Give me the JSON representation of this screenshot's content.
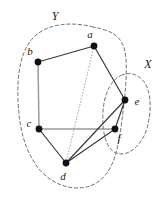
{
  "figure": {
    "width": 164,
    "height": 203,
    "background": "#ffffff"
  },
  "labels": {
    "a": "a",
    "b": "b",
    "c": "c",
    "d": "d",
    "e": "e",
    "f": "f",
    "X": "X",
    "Y": "Y"
  },
  "colors": {
    "vertex": "#111111",
    "edge_dark": "#3a3a3a",
    "edge_gray": "#9a9a9a",
    "edge_dotted": "#b0b0b0",
    "region_boundary": "#6e6e6e",
    "text": "#1a1a1a",
    "background": "#ffffff"
  },
  "chart_data": {
    "type": "diagram",
    "title": "",
    "nodes": [
      {
        "id": "a",
        "label": "a",
        "x": 94,
        "y": 46,
        "label_x": 90,
        "label_y": 38,
        "r": 3.4
      },
      {
        "id": "b",
        "label": "b",
        "x": 38,
        "y": 62,
        "label_x": 30,
        "label_y": 55,
        "r": 3.4
      },
      {
        "id": "c",
        "label": "c",
        "x": 39,
        "y": 129,
        "label_x": 29,
        "label_y": 127,
        "r": 3.4
      },
      {
        "id": "d",
        "label": "d",
        "x": 66,
        "y": 163,
        "label_x": 63,
        "label_y": 180,
        "r": 3.4
      },
      {
        "id": "e",
        "label": "e",
        "x": 125,
        "y": 100,
        "label_x": 137,
        "label_y": 105,
        "r": 3.4
      },
      {
        "id": "f",
        "label": "f",
        "x": 115,
        "y": 129,
        "label_x": 119,
        "label_y": 142,
        "r": 3.4
      }
    ],
    "edges": [
      {
        "from": "a",
        "to": "b",
        "style": "solid",
        "color": "#3a3a3a",
        "width": 1.2
      },
      {
        "from": "b",
        "to": "c",
        "style": "solid",
        "color": "#9a9a9a",
        "width": 1.5
      },
      {
        "from": "c",
        "to": "f",
        "style": "solid",
        "color": "#9a9a9a",
        "width": 1.5
      },
      {
        "from": "c",
        "to": "d",
        "style": "solid",
        "color": "#3a3a3a",
        "width": 1.2
      },
      {
        "from": "a",
        "to": "e",
        "style": "solid",
        "color": "#3a3a3a",
        "width": 1.2
      },
      {
        "from": "a",
        "to": "d",
        "style": "dotted",
        "color": "#b0b0b0",
        "width": 1.2
      },
      {
        "from": "d",
        "to": "e",
        "style": "solid",
        "color": "#3a3a3a",
        "width": 1.2
      },
      {
        "from": "d",
        "to": "f",
        "style": "solid",
        "color": "#3a3a3a",
        "width": 1.2
      },
      {
        "from": "e",
        "to": "f",
        "style": "solid",
        "color": "#3a3a3a",
        "width": 1.2
      }
    ],
    "regions": [
      {
        "id": "Y",
        "label": "Y",
        "label_x": 55,
        "label_y": 20,
        "members": [
          "a",
          "b",
          "c",
          "d"
        ],
        "style": "dashed",
        "color": "#6e6e6e",
        "path": "M 93 27 C 70 21 46 24 33 38 C 20 52 17 76 18 100 C 19 124 23 146 36 165 C 49 184 72 192 90 186 C 104 181 112 168 116 153 C 120 138 122 120 124 104 C 126 84 128 62 124 48 C 120 34 108 30 93 27 Z"
      },
      {
        "id": "X",
        "label": "X",
        "label_x": 148,
        "label_y": 68,
        "members": [
          "e",
          "f"
        ],
        "style": "dashed",
        "color": "#6e6e6e",
        "path": "M 122 75 C 110 80 104 95 103 112 C 102 130 105 146 114 152 C 124 158 137 150 144 136 C 151 121 152 100 147 87 C 142 76 132 71 122 75 Z"
      }
    ],
    "xlabel": "",
    "ylabel": "",
    "legend": []
  }
}
